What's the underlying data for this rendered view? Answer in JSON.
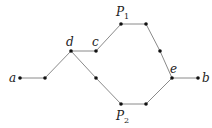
{
  "diagram": {
    "type": "graph",
    "width": 212,
    "height": 128,
    "colors": {
      "edge": "#8a8a8a",
      "node": "#111111",
      "label": "#222222"
    },
    "nodes": [
      {
        "id": "a",
        "x": 20,
        "y": 78,
        "label": "a"
      },
      {
        "id": "n1",
        "x": 45,
        "y": 78,
        "label": ""
      },
      {
        "id": "d",
        "x": 71,
        "y": 51,
        "label": "d"
      },
      {
        "id": "c",
        "x": 96,
        "y": 51,
        "label": "c"
      },
      {
        "id": "p1a",
        "x": 121,
        "y": 24,
        "label": ""
      },
      {
        "id": "p1b",
        "x": 146,
        "y": 24,
        "label": ""
      },
      {
        "id": "n2",
        "x": 160,
        "y": 51,
        "label": ""
      },
      {
        "id": "e",
        "x": 172,
        "y": 78,
        "label": "e"
      },
      {
        "id": "b",
        "x": 198,
        "y": 78,
        "label": "b"
      },
      {
        "id": "n3",
        "x": 96,
        "y": 78,
        "label": ""
      },
      {
        "id": "p2a",
        "x": 121,
        "y": 104,
        "label": ""
      },
      {
        "id": "p2b",
        "x": 146,
        "y": 104,
        "label": ""
      }
    ],
    "edges": [
      [
        "a",
        "n1"
      ],
      [
        "n1",
        "d"
      ],
      [
        "d",
        "c"
      ],
      [
        "c",
        "p1a"
      ],
      [
        "p1a",
        "p1b"
      ],
      [
        "p1b",
        "n2"
      ],
      [
        "n2",
        "e"
      ],
      [
        "e",
        "b"
      ],
      [
        "d",
        "n3"
      ],
      [
        "n3",
        "p2a"
      ],
      [
        "p2a",
        "p2b"
      ],
      [
        "p2b",
        "e"
      ]
    ],
    "labels": {
      "a": "a",
      "b": "b",
      "c": "c",
      "d": "d",
      "e": "e",
      "p1_main": "P",
      "p1_sub": "1",
      "p2_main": "P",
      "p2_sub": "2"
    }
  }
}
